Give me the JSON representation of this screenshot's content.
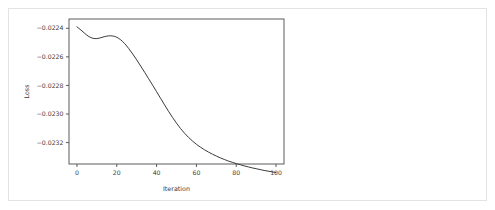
{
  "figure": {
    "background_color": "#ffffff",
    "card_border_color": "#e3e3e3",
    "line_color": "#3b3b3b",
    "axis_color": "#4a4a4a",
    "text_color": "#3c3c3c"
  },
  "chart_data": {
    "type": "line",
    "title": "",
    "xlabel": "Iteration",
    "ylabel": "Loss",
    "xlim": [
      -4,
      104
    ],
    "ylim": [
      -0.02335,
      -0.022335
    ],
    "grid": false,
    "legend": null,
    "xticks": [
      0,
      20,
      40,
      60,
      80,
      100
    ],
    "xtick_labels": [
      "0",
      "20",
      "40",
      "60",
      "80",
      "100"
    ],
    "yticks": [
      -0.0224,
      -0.0226,
      -0.0228,
      -0.023,
      -0.0232
    ],
    "ytick_labels": [
      "−0.0224",
      "−0.0226",
      "−0.0228",
      "−0.0230",
      "−0.0232"
    ],
    "series": [
      {
        "name": "Loss",
        "color": "#3b3b3b",
        "x": [
          0,
          2,
          4,
          6,
          8,
          10,
          12,
          14,
          16,
          18,
          20,
          22,
          24,
          26,
          28,
          30,
          32,
          34,
          36,
          38,
          40,
          42,
          44,
          46,
          48,
          50,
          52,
          54,
          56,
          58,
          60,
          62,
          64,
          66,
          68,
          70,
          72,
          74,
          76,
          78,
          80,
          82,
          84,
          86,
          88,
          90,
          92,
          94,
          96,
          98,
          100
        ],
        "y": [
          -0.02239,
          -0.022412,
          -0.022437,
          -0.022458,
          -0.02247,
          -0.022472,
          -0.022466,
          -0.022458,
          -0.022453,
          -0.022454,
          -0.022463,
          -0.022481,
          -0.022508,
          -0.022542,
          -0.02258,
          -0.022621,
          -0.022664,
          -0.022708,
          -0.022753,
          -0.022798,
          -0.022844,
          -0.02289,
          -0.022936,
          -0.022981,
          -0.023024,
          -0.023064,
          -0.023101,
          -0.023134,
          -0.023163,
          -0.023189,
          -0.023212,
          -0.023232,
          -0.02325,
          -0.023266,
          -0.023281,
          -0.023294,
          -0.023307,
          -0.023318,
          -0.023329,
          -0.023338,
          -0.023347,
          -0.023355,
          -0.023363,
          -0.02337,
          -0.023377,
          -0.023383,
          -0.023389,
          -0.023395,
          -0.0234,
          -0.023405,
          -0.02341
        ]
      }
    ]
  }
}
